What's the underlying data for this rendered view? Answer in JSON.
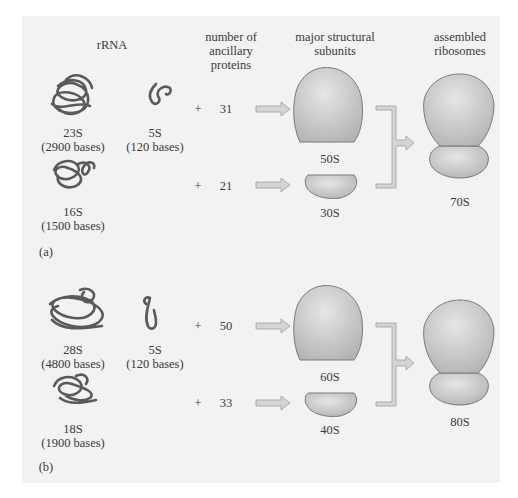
{
  "headers": {
    "rrna": "rRNA",
    "proteins": [
      "number of",
      "ancillary",
      "proteins"
    ],
    "subunits": [
      "major structural",
      "subunits"
    ],
    "ribosomes": [
      "assembled",
      "ribosomes"
    ]
  },
  "panels": [
    {
      "label": "(a)",
      "large_rrna": {
        "name": "23S",
        "size": "(2900 bases)"
      },
      "small5s_rrna": {
        "name": "5S",
        "size": "(120 bases)"
      },
      "small_rrna": {
        "name": "16S",
        "size": "(1500 bases)"
      },
      "plus": "+",
      "large_proteins": "31",
      "small_proteins": "21",
      "large_subunit": "50S",
      "small_subunit": "30S",
      "ribosome": "70S"
    },
    {
      "label": "(b)",
      "large_rrna": {
        "name": "28S",
        "size": "(4800 bases)"
      },
      "small5s_rrna": {
        "name": "5S",
        "size": "(120 bases)"
      },
      "small_rrna": {
        "name": "18S",
        "size": "(1900 bases)"
      },
      "plus": "+",
      "large_proteins": "50",
      "small_proteins": "33",
      "large_subunit": "60S",
      "small_subunit": "40S",
      "ribosome": "80S"
    }
  ],
  "colors": {
    "background": "#f2f2f2",
    "rna_strand": "#5a5a5a",
    "arrow_fill": "#d4d4d4",
    "subunit_fill": "#c8c8c8"
  }
}
